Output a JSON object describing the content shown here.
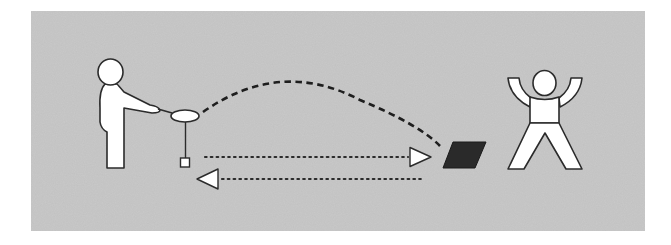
{
  "diagram": {
    "colors": {
      "background": "#ffffff",
      "panel": "#c9c9c9",
      "figure_fill": "#ffffff",
      "outline": "#2b2b2b",
      "target": "#2a2a2a",
      "dash": "#1e1e1e"
    },
    "elements": {
      "panel": {
        "x": 31,
        "y": 11,
        "w": 614,
        "h": 220
      },
      "left_figure": {
        "label": "person-with-racket"
      },
      "right_figure": {
        "label": "person-arms-raised"
      },
      "target": {
        "label": "target-mat"
      },
      "trajectory": {
        "label": "thrown-arc",
        "style": "dashed"
      },
      "arrow_forward": {
        "label": "to-target",
        "style": "dotted",
        "direction": "right"
      },
      "arrow_back": {
        "label": "return",
        "style": "dotted",
        "direction": "left"
      }
    }
  }
}
